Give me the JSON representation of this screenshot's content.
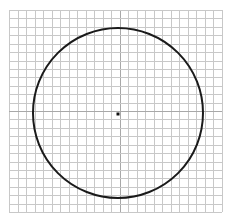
{
  "diagram": {
    "type": "circle-on-grid",
    "grid": {
      "x": 9,
      "y": 10,
      "width": 213,
      "height": 202,
      "cols": 25,
      "rows": 24,
      "line_color": "#c8c8c8",
      "center_line_color": "#a8a8a8"
    },
    "circle": {
      "cx": 118,
      "cy": 113,
      "r": 85,
      "stroke": "#1a1a1a",
      "stroke_width": 2
    },
    "center_point": {
      "cx": 118,
      "cy": 114,
      "size": 3,
      "color": "#111111"
    }
  }
}
